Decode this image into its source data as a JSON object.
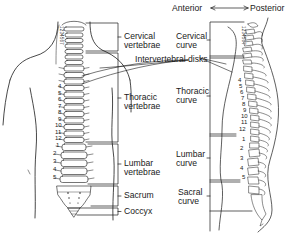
{
  "diagram": {
    "type": "anatomical-diagram",
    "colors": {
      "line": "#1a1a1a",
      "background": "#ffffff",
      "text": "#1a1a1a"
    },
    "direction_indicator": {
      "left_label": "Anterior",
      "right_label": "Posterior",
      "arrow": "double-headed-arrow"
    },
    "anterior_view": {
      "labels": {
        "cervical": [
          "Cervical",
          "vertebrae"
        ],
        "thoracic": [
          "Thoracic",
          "vertebrae"
        ],
        "lumbar": [
          "Lumbar",
          "vertebrae"
        ],
        "sacrum": "Sacrum",
        "coccyx": "Coccyx"
      },
      "thoracic_numbers": [
        "4",
        "5",
        "6",
        "7",
        "8",
        "9",
        "10",
        "11",
        "12"
      ],
      "lumbar_numbers": [
        "1",
        "2",
        "3",
        "4",
        "5"
      ],
      "cervical_numbers": "1234567"
    },
    "shared_label": "Intervertebral disks",
    "lateral_view": {
      "labels": {
        "cervical": [
          "Cervical",
          "curve"
        ],
        "thoracic": [
          "Thoracic",
          "curve"
        ],
        "lumbar": [
          "Lumbar",
          "curve"
        ],
        "sacral": [
          "Sacral",
          "curve"
        ]
      },
      "thoracic_numbers": [
        "4",
        "5",
        "6",
        "7",
        "8",
        "9",
        "10",
        "11",
        "12"
      ],
      "lumbar_numbers": [
        "1",
        "2",
        "3",
        "4",
        "5"
      ],
      "cervical_numbers": "1234567"
    }
  }
}
